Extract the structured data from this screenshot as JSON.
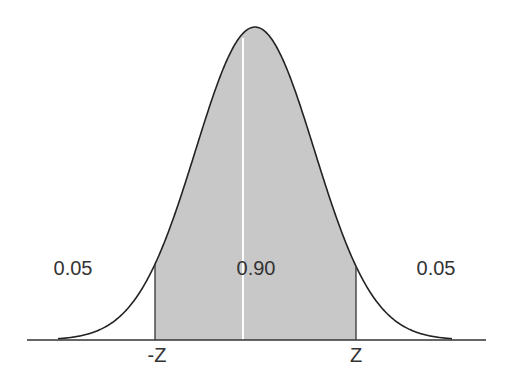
{
  "chart_data": {
    "type": "area",
    "title": "",
    "distribution": "normal",
    "regions": [
      {
        "name": "left-tail",
        "label": "0.05",
        "shaded": false,
        "range": [
          "-inf",
          "-Z"
        ]
      },
      {
        "name": "center",
        "label": "0.90",
        "shaded": true,
        "range": [
          "-Z",
          "Z"
        ]
      },
      {
        "name": "right-tail",
        "label": "0.05",
        "shaded": false,
        "range": [
          "Z",
          "inf"
        ]
      }
    ],
    "x_tick_labels": [
      "-Z",
      "Z"
    ],
    "xlabel": "",
    "ylabel": "",
    "grid": false,
    "colors": {
      "fill": "#c8c8c8",
      "curve": "#222222",
      "axis": "#333333",
      "center_line": "#ffffff",
      "text": "#333333"
    }
  },
  "labels": {
    "left_tail": "0.05",
    "center": "0.90",
    "right_tail": "0.05",
    "neg_z": "-Z",
    "pos_z": "Z"
  }
}
